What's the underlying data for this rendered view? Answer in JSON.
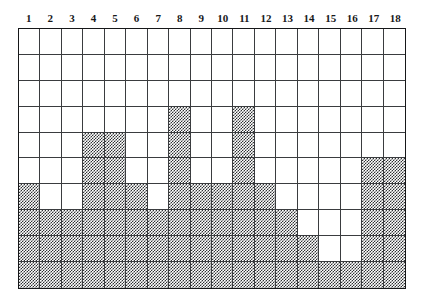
{
  "figure": {
    "kind": "shaded-grid-histogram",
    "columns": 18,
    "rows": 10,
    "fill_color": "#2f3134",
    "background_color": "#ffffff",
    "grid_line_color": "#3a3c3f",
    "border_color": "#161719"
  },
  "column_labels": [
    "1",
    "2",
    "3",
    "4",
    "5",
    "6",
    "7",
    "8",
    "9",
    "10",
    "11",
    "12",
    "13",
    "14",
    "15",
    "16",
    "17",
    "18"
  ],
  "chart_data": {
    "type": "bar",
    "title": "",
    "xlabel": "",
    "ylabel": "",
    "categories": [
      "1",
      "2",
      "3",
      "4",
      "5",
      "6",
      "7",
      "8",
      "9",
      "10",
      "11",
      "12",
      "13",
      "14",
      "15",
      "16",
      "17",
      "18"
    ],
    "values": [
      4,
      3,
      3,
      6,
      6,
      4,
      3,
      7,
      4,
      4,
      7,
      4,
      3,
      2,
      1,
      1,
      5,
      5
    ],
    "ylim": [
      0,
      10
    ],
    "grid": true,
    "legend": "none",
    "note": "Each column is a stack of shaded unit cells counted from the bottom row upward; grid is 18 columns by 10 rows.",
    "filled_cells_by_row": {
      "row_1": [],
      "row_2": [],
      "row_3": [],
      "row_4": [
        8,
        11
      ],
      "row_5": [
        4,
        5,
        8,
        11
      ],
      "row_6": [
        4,
        5,
        8,
        11,
        17,
        18
      ],
      "row_7": [
        1,
        4,
        5,
        6,
        8,
        9,
        10,
        11,
        12,
        17,
        18
      ],
      "row_8": [
        1,
        2,
        3,
        4,
        5,
        6,
        7,
        8,
        9,
        10,
        11,
        12,
        13,
        17,
        18
      ],
      "row_9": [
        1,
        2,
        3,
        4,
        5,
        6,
        7,
        8,
        9,
        10,
        11,
        12,
        13,
        14,
        17,
        18
      ],
      "row_10": [
        1,
        2,
        3,
        4,
        5,
        6,
        7,
        8,
        9,
        10,
        11,
        12,
        13,
        14,
        15,
        16,
        17,
        18
      ]
    }
  }
}
